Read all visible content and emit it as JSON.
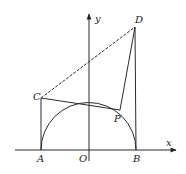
{
  "diagram": {
    "type": "geometry",
    "axes": {
      "x_label": "x",
      "y_label": "y",
      "origin_label": "O"
    },
    "points": {
      "A": {
        "label": "A",
        "x": 41,
        "y": 150
      },
      "B": {
        "label": "B",
        "x": 136,
        "y": 150
      },
      "O": {
        "label": "O",
        "x": 89,
        "y": 150
      },
      "C": {
        "label": "C",
        "x": 41,
        "y": 98
      },
      "D": {
        "label": "D",
        "x": 135,
        "y": 27
      },
      "P": {
        "label": "P",
        "x": 120,
        "y": 110
      }
    },
    "segments": [
      "AC",
      "BD",
      "CD",
      "CP",
      "DP"
    ],
    "curves": [
      "semicircle on AB, center O"
    ],
    "colors": {
      "stroke": "#2a2a2a",
      "background": "#ffffff"
    }
  }
}
